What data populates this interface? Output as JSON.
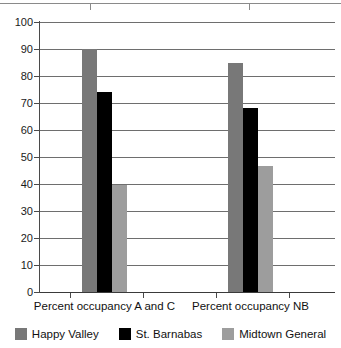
{
  "chart_data": {
    "type": "bar",
    "title": "",
    "subtitle": "",
    "xlabel": "",
    "ylabel": "",
    "ylim": [
      0,
      100
    ],
    "yticks": [
      0,
      10,
      20,
      30,
      40,
      50,
      60,
      70,
      80,
      90,
      100
    ],
    "grid": true,
    "legend_position": "bottom",
    "categories": [
      "Percent occupancy A and C",
      "Percent occupancy NB"
    ],
    "series": [
      {
        "name": "Happy Valley",
        "color": "#787878",
        "values": [
          90,
          85
        ]
      },
      {
        "name": "St. Barnabas",
        "color": "#000000",
        "values": [
          74,
          68
        ]
      },
      {
        "name": "Midtown General",
        "color": "#9d9d9d",
        "values": [
          39.5,
          46.5
        ]
      }
    ]
  },
  "axis": {
    "y_tick_labels": [
      "100",
      "90",
      "80",
      "70",
      "60",
      "50",
      "40",
      "30",
      "20",
      "10",
      "0"
    ]
  },
  "x_labels": {
    "group1": "Percent occupancy A and C",
    "group2": "Percent occupancy NB"
  },
  "legend": {
    "items": [
      {
        "label": "Happy Valley",
        "color": "#787878"
      },
      {
        "label": "St. Barnabas",
        "color": "#000000"
      },
      {
        "label": "Midtown General",
        "color": "#9d9d9d"
      }
    ]
  },
  "colors": {
    "happy_valley": "#787878",
    "st_barnabas": "#000000",
    "midtown_general": "#9d9d9d",
    "gridline": "#6e6e6e",
    "axis": "#3a3a3a",
    "background": "#ffffff"
  }
}
